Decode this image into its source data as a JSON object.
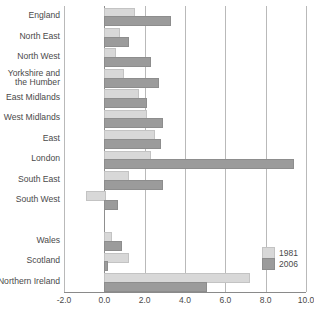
{
  "chart_data": {
    "type": "bar",
    "orientation": "horizontal",
    "title": "",
    "subtitle": "",
    "xlabel": "",
    "ylabel": "",
    "xlim": [
      -2.0,
      10.0
    ],
    "xticks": [
      "-2.0",
      "0.0",
      "2.0",
      "4.0",
      "6.0",
      "8.0",
      "10.0"
    ],
    "xtick_values": [
      -2.0,
      0.0,
      2.0,
      4.0,
      6.0,
      8.0,
      10.0
    ],
    "grid": "vertical",
    "legend_position": "bottom-right",
    "categories": [
      "England",
      "North East",
      "North West",
      "Yorkshire and\nthe Humber",
      "East Midlands",
      "West Midlands",
      "East",
      "London",
      "South East",
      "South West",
      "",
      "Wales",
      "Scotland",
      "Northern Ireland"
    ],
    "series": [
      {
        "name": "1981",
        "color": "#d8d8d8",
        "values": [
          1.4,
          0.7,
          0.5,
          0.9,
          1.6,
          2.0,
          2.4,
          2.2,
          1.1,
          -0.9,
          null,
          0.3,
          1.1,
          7.1
        ]
      },
      {
        "name": "2006",
        "color": "#9b9b9b",
        "values": [
          3.2,
          1.1,
          2.2,
          2.6,
          2.0,
          2.8,
          2.7,
          9.3,
          2.8,
          0.6,
          null,
          0.8,
          0.1,
          5.0
        ]
      }
    ]
  },
  "legend": {
    "entries": [
      {
        "label": "1981"
      },
      {
        "label": "2006"
      }
    ]
  }
}
